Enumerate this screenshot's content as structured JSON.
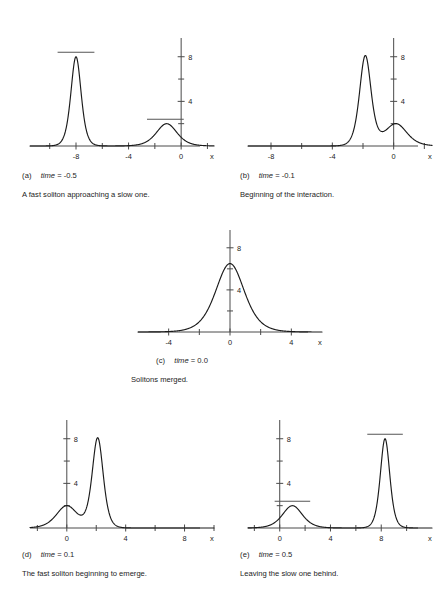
{
  "figure": {
    "background": "#ffffff",
    "curve_color": "#1b1b1b",
    "axis_color": "#4a4a4a",
    "marker_color": "#555555"
  },
  "panels": [
    {
      "id": "a",
      "label": "(a)",
      "time_label": "time",
      "time_value": "= -0.5",
      "caption": "A fast soliton approaching a slow one.",
      "x_ticklabels": [
        "-8",
        "-4",
        "0"
      ],
      "y_ticklabels": [
        "4",
        "8"
      ],
      "x_axis_label": "x"
    },
    {
      "id": "b",
      "label": "(b)",
      "time_label": "time",
      "time_value": "= -0.1",
      "caption": "Beginning of the interaction.",
      "x_ticklabels": [
        "-8",
        "-4",
        "0"
      ],
      "y_ticklabels": [
        "4",
        "8"
      ],
      "x_axis_label": "x"
    },
    {
      "id": "c",
      "label": "(c)",
      "time_label": "time",
      "time_value": "= 0.0",
      "caption": "Solitons merged.",
      "x_ticklabels": [
        "-4",
        "0",
        "4"
      ],
      "y_ticklabels": [
        "4",
        "8"
      ],
      "x_axis_label": "x"
    },
    {
      "id": "d",
      "label": "(d)",
      "time_label": "time",
      "time_value": "= 0.1",
      "caption": "The fast soliton beginning to emerge.",
      "x_ticklabels": [
        "0",
        "4",
        "8"
      ],
      "y_ticklabels": [
        "4",
        "8"
      ],
      "x_axis_label": "x"
    },
    {
      "id": "e",
      "label": "(e)",
      "time_label": "time",
      "time_value": "= 0.5",
      "caption": "Leaving the slow one behind.",
      "x_ticklabels": [
        "0",
        "4",
        "8"
      ],
      "y_ticklabels": [
        "4",
        "8"
      ],
      "x_axis_label": "x"
    }
  ],
  "chart_data": [
    {
      "type": "line",
      "panel": "a",
      "title": "time = -0.5",
      "xlabel": "x",
      "ylabel": "",
      "xlim": [
        -11.5,
        2.5
      ],
      "ylim": [
        0,
        9.5
      ],
      "xticks": [
        -8,
        -4,
        0
      ],
      "xminorticks": [
        -10,
        -6,
        -2,
        2
      ],
      "yticks": [
        4,
        8
      ],
      "yminorticks": [
        2,
        6
      ],
      "grid": false,
      "legend": null,
      "peaks": [
        {
          "center": -8.0,
          "amplitude": 8.0,
          "width": 0.52,
          "role": "fast-soliton"
        },
        {
          "center": -1.1,
          "amplitude": 2.0,
          "width": 1.05,
          "role": "slow-soliton"
        }
      ],
      "markers": [
        {
          "y": 8.0,
          "x_start": -9.4,
          "x_end": -6.6
        },
        {
          "y": 2.0,
          "x_start": -2.6,
          "x_end": 0.2
        }
      ]
    },
    {
      "type": "line",
      "panel": "b",
      "title": "time = -0.1",
      "xlabel": "x",
      "ylabel": "",
      "xlim": [
        -9.5,
        2.5
      ],
      "ylim": [
        0,
        9.5
      ],
      "xticks": [
        -8,
        -4,
        0
      ],
      "xminorticks": [
        -6,
        -2,
        2
      ],
      "yticks": [
        4,
        8
      ],
      "yminorticks": [
        2,
        6
      ],
      "grid": false,
      "legend": null,
      "peaks": [
        {
          "center": -1.85,
          "amplitude": 8.0,
          "width": 0.5,
          "role": "fast-soliton"
        },
        {
          "center": 0.15,
          "amplitude": 2.0,
          "width": 0.95,
          "role": "slow-soliton"
        }
      ],
      "markers": []
    },
    {
      "type": "line",
      "panel": "c",
      "title": "time = 0.0",
      "xlabel": "x",
      "ylabel": "",
      "xlim": [
        -6.0,
        6.0
      ],
      "ylim": [
        0,
        9.5
      ],
      "xticks": [
        -4,
        0,
        4
      ],
      "xminorticks": [
        -2,
        2
      ],
      "yticks": [
        4,
        8
      ],
      "yminorticks": [
        2,
        6
      ],
      "grid": false,
      "legend": null,
      "peaks": [
        {
          "center": 0.0,
          "amplitude": 6.5,
          "width": 1.25,
          "role": "merged-soliton"
        }
      ],
      "markers": []
    },
    {
      "type": "line",
      "panel": "d",
      "title": "time = 0.1",
      "xlabel": "x",
      "ylabel": "",
      "xlim": [
        -2.5,
        10.0
      ],
      "ylim": [
        0,
        9.5
      ],
      "xticks": [
        0,
        4,
        8
      ],
      "xminorticks": [
        -2,
        2,
        6,
        10
      ],
      "yticks": [
        4,
        8
      ],
      "yminorticks": [
        2,
        6
      ],
      "grid": false,
      "legend": null,
      "peaks": [
        {
          "center": 0.0,
          "amplitude": 2.0,
          "width": 0.95,
          "role": "slow-soliton"
        },
        {
          "center": 2.1,
          "amplitude": 8.0,
          "width": 0.5,
          "role": "fast-soliton"
        }
      ],
      "markers": []
    },
    {
      "type": "line",
      "panel": "e",
      "title": "time = 0.5",
      "xlabel": "x",
      "ylabel": "",
      "xlim": [
        -2.5,
        12.0
      ],
      "ylim": [
        0,
        9.5
      ],
      "xticks": [
        0,
        4,
        8
      ],
      "xminorticks": [
        -2,
        2,
        6,
        10
      ],
      "yticks": [
        4,
        8
      ],
      "yminorticks": [
        2,
        6
      ],
      "grid": false,
      "legend": null,
      "peaks": [
        {
          "center": 1.0,
          "amplitude": 2.0,
          "width": 1.05,
          "role": "slow-soliton"
        },
        {
          "center": 8.3,
          "amplitude": 8.0,
          "width": 0.5,
          "role": "fast-soliton"
        }
      ],
      "markers": [
        {
          "y": 2.0,
          "x_start": -0.4,
          "x_end": 2.4
        },
        {
          "y": 8.0,
          "x_start": 6.9,
          "x_end": 9.7
        }
      ]
    }
  ]
}
